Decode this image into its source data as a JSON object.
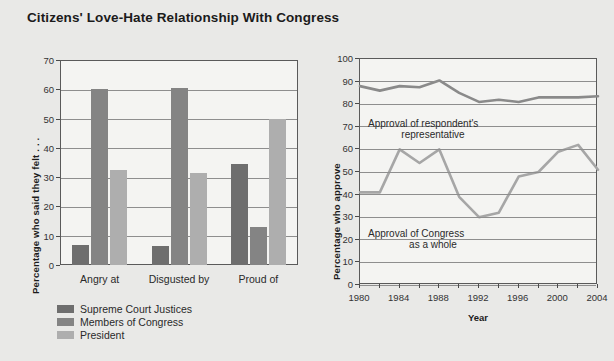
{
  "title": "Citizens' Love-Hate Relationship With Congress",
  "colors": {
    "background": "#e9e9e7",
    "plot_background": "#f4f4f2",
    "axis": "#5a5a5a",
    "grid": "#8e8e8e",
    "supreme_court": "#6e6e6e",
    "members_congress": "#848484",
    "president": "#aeaeae",
    "line_representative": "#8a8a8a",
    "line_congress": "#a6a6a6"
  },
  "chart_data": [
    {
      "type": "bar",
      "id": "felt-about",
      "title": "",
      "xlabel": "",
      "ylabel": "Percentage who said they felt . . .",
      "ylim": [
        0,
        70
      ],
      "yticks": [
        0,
        10,
        20,
        30,
        40,
        50,
        60,
        70
      ],
      "grid": true,
      "legend_position": "below",
      "categories": [
        "Angry at",
        "Disgusted by",
        "Proud of"
      ],
      "series": [
        {
          "name": "Supreme Court Justices",
          "color": "#6e6e6e",
          "values": [
            7,
            6.5,
            34.5
          ]
        },
        {
          "name": "Members of Congress",
          "color": "#848484",
          "values": [
            60,
            60.5,
            13
          ]
        },
        {
          "name": "President",
          "color": "#aeaeae",
          "values": [
            32.5,
            31.5,
            50
          ]
        }
      ]
    },
    {
      "type": "line",
      "id": "approval-over-time",
      "title": "",
      "xlabel": "Year",
      "ylabel": "Percentage who approve",
      "ylim": [
        0,
        100
      ],
      "yticks": [
        0,
        10,
        20,
        30,
        40,
        50,
        60,
        70,
        80,
        90,
        100
      ],
      "xlim": [
        1980,
        2004
      ],
      "xticks": [
        1980,
        1982,
        1984,
        1986,
        1988,
        1990,
        1992,
        1994,
        1996,
        1998,
        2000,
        2002,
        2004
      ],
      "xtick_labels": [
        "1980",
        "",
        "1984",
        "",
        "1988",
        "",
        "1992",
        "",
        "1996",
        "",
        "2000",
        "",
        "2004"
      ],
      "grid": true,
      "x": [
        1980,
        1982,
        1984,
        1986,
        1988,
        1990,
        1992,
        1994,
        1996,
        1998,
        2000,
        2002,
        2004
      ],
      "series": [
        {
          "name": "Approval of respondent's representative",
          "color": "#8a8a8a",
          "values": [
            88,
            86,
            88,
            87.5,
            90.5,
            85,
            81,
            82,
            81,
            83,
            83,
            83,
            83.5
          ]
        },
        {
          "name": "Approval of Congress as a whole",
          "color": "#a6a6a6",
          "values": [
            41,
            41,
            60,
            54,
            60,
            39,
            30,
            32,
            48,
            50,
            59,
            62,
            51
          ]
        }
      ],
      "annotations": [
        {
          "id": "annot-representative",
          "line1": "Approval of respondent's",
          "line2": "representative"
        },
        {
          "id": "annot-congress",
          "line1": "Approval of Congress",
          "line2": "as a whole"
        }
      ]
    }
  ]
}
